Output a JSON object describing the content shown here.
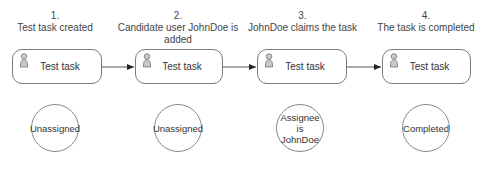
{
  "steps": [
    {
      "number": "1.",
      "title_line1": "Test task created",
      "title_line2": "",
      "task": "Test task",
      "state_line1": "Unassigned",
      "state_line2": ""
    },
    {
      "number": "2.",
      "title_line1": "Candidate user JohnDoe is",
      "title_line2": "added",
      "task": "Test task",
      "state_line1": "Unassigned",
      "state_line2": ""
    },
    {
      "number": "3.",
      "title_line1": "JohnDoe claims the task",
      "title_line2": "",
      "task": "Test task",
      "state_line1": "Assignee is",
      "state_line2": "JohnDoe"
    },
    {
      "number": "4.",
      "title_line1": "The task is completed",
      "title_line2": "",
      "task": "Test task",
      "state_line1": "Completed",
      "state_line2": ""
    }
  ],
  "icons": {
    "task_icon": "user-icon",
    "connector": "arrow-right-icon"
  },
  "colors": {
    "stroke": "#7a7a7a",
    "icon_fill": "#c8c8c8",
    "text": "#333333"
  }
}
